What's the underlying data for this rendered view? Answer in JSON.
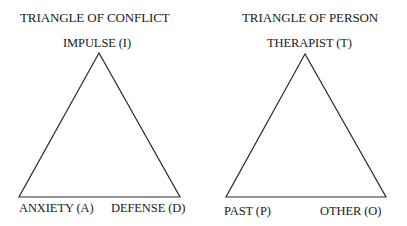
{
  "diagrams": [
    {
      "title": "TRIANGLE OF CONFLICT",
      "vertices": {
        "top": {
          "label": "IMPULSE (I)",
          "x": 99,
          "y": 53
        },
        "bottom_left": {
          "label": "ANXIETY (A)",
          "x": 19,
          "y": 197
        },
        "bottom_right": {
          "label": "DEFENSE (D)",
          "x": 180,
          "y": 197
        }
      }
    },
    {
      "title": "TRIANGLE OF PERSON",
      "vertices": {
        "top": {
          "label": "THERAPIST (T)",
          "x": 305,
          "y": 54
        },
        "bottom_left": {
          "label": "PAST (P)",
          "x": 226,
          "y": 197
        },
        "bottom_right": {
          "label": "OTHER (O)",
          "x": 386,
          "y": 197
        }
      }
    }
  ],
  "colors": {
    "line": "#2a2a2a",
    "text": "#1a1a1a",
    "background": "#ffffff"
  }
}
